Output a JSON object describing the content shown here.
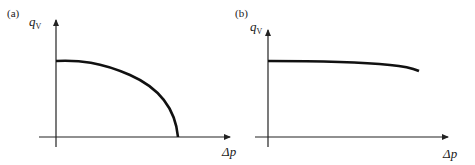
{
  "figure": {
    "panels": [
      {
        "id": "a",
        "label": "(a)",
        "y_axis_label": "q",
        "y_axis_subscript": "V",
        "x_axis_label": "Δp",
        "curve_description": "flow rate starts high at Δp=0 and drops steeply to zero"
      },
      {
        "id": "b",
        "label": "(b)",
        "y_axis_label": "q",
        "y_axis_subscript": "V",
        "x_axis_label": "Δp",
        "curve_description": "flow rate nearly constant, slightly decreasing with Δp"
      }
    ]
  },
  "colors": {
    "line": "#111111",
    "axis": "#222222",
    "background": "#ffffff"
  }
}
